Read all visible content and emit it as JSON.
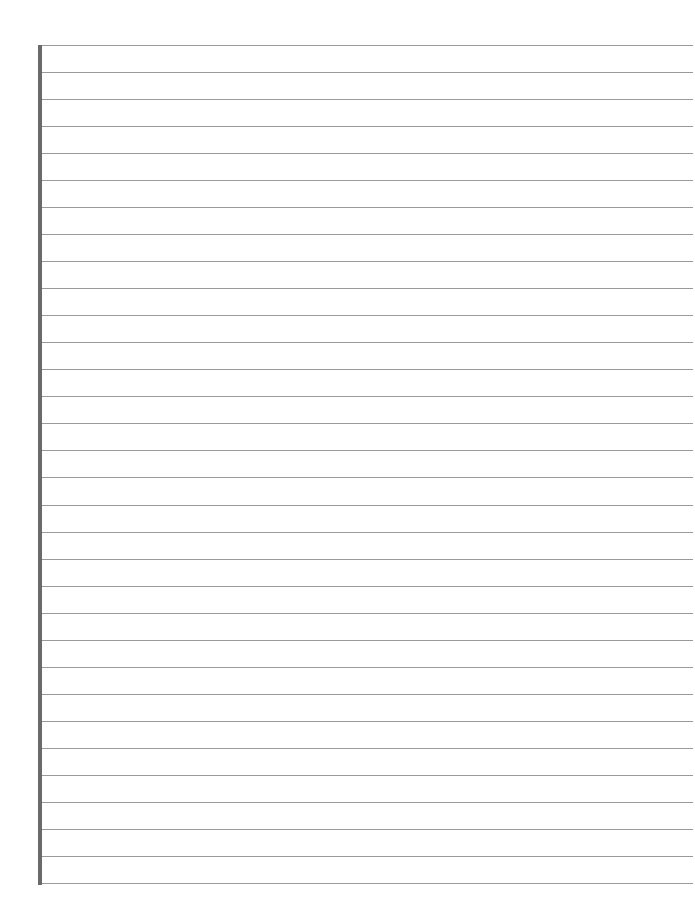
{
  "page": {
    "type": "lined-paper",
    "background": "#ffffff",
    "margin_bar_color": "#6a6a6a",
    "rule_color": "#9a9a9a",
    "rule_count": 32,
    "first_rule_y": 45,
    "rule_spacing": 27.03
  }
}
